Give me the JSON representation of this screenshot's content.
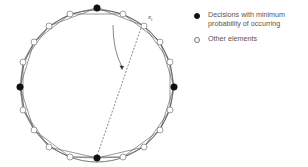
{
  "diagram": {
    "center": [
      97,
      86
    ],
    "radius": 76,
    "label": "x",
    "label_sub": "i",
    "filled_nodes": [
      [
        97,
        8
      ],
      [
        174,
        87
      ],
      [
        97,
        158
      ],
      [
        20,
        87
      ]
    ],
    "open_nodes": [
      [
        70,
        14
      ],
      [
        123,
        14
      ],
      [
        144,
        26
      ],
      [
        160,
        42
      ],
      [
        170,
        62
      ],
      [
        170,
        110
      ],
      [
        160,
        130
      ],
      [
        144,
        147
      ],
      [
        123,
        157
      ],
      [
        70,
        157
      ],
      [
        49,
        147
      ],
      [
        34,
        130
      ],
      [
        23,
        110
      ],
      [
        23,
        62
      ],
      [
        34,
        42
      ],
      [
        49,
        26
      ]
    ],
    "colors": {
      "line": "#555555",
      "filled": "#111111",
      "open_fill": "#ffffff",
      "open_stroke": "#777777"
    }
  },
  "legend": {
    "items": [
      {
        "marker": "filled",
        "label": "Decisions with minimum probability of occurring"
      },
      {
        "marker": "open",
        "label": "Other elements"
      }
    ]
  }
}
